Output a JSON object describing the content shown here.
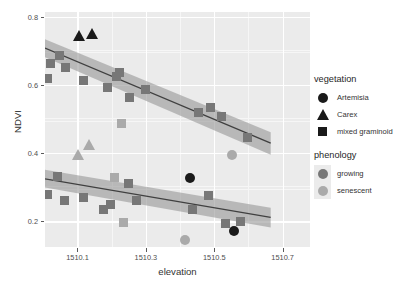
{
  "chart_data": {
    "type": "scatter",
    "title": "",
    "xlabel": "elevation",
    "ylabel": "NDVI",
    "xlim": [
      1510.005,
      1510.78
    ],
    "ylim": [
      0.125,
      0.815
    ],
    "xticks": [
      "1510.1",
      "1510.3",
      "1510.5",
      "1510.7"
    ],
    "xtick_values": [
      1510.1,
      1510.3,
      1510.5,
      1510.7
    ],
    "yticks": [
      "0.2",
      "0.4",
      "0.6",
      "0.8"
    ],
    "ytick_values": [
      0.2,
      0.4,
      0.6,
      0.8
    ],
    "grid": true,
    "legend_position": "right",
    "panel_background": "#ebebeb",
    "colors": {
      "growing": "#777777",
      "senescent": "#aaaaaa",
      "dark_marker": "#1a1a1a",
      "fit_line": "#404040",
      "ribbon_growing": "#9a9a9a",
      "ribbon_senescent": "#b8b8b8"
    },
    "series": [
      {
        "name": "growing",
        "phenology": "growing",
        "color": "#777777",
        "points": [
          {
            "x": 1510.013,
            "y": 0.619,
            "vegetation": "mixed graminoid"
          },
          {
            "x": 1510.02,
            "y": 0.665,
            "vegetation": "mixed graminoid"
          },
          {
            "x": 1510.048,
            "y": 0.686,
            "vegetation": "mixed graminoid"
          },
          {
            "x": 1510.064,
            "y": 0.653,
            "vegetation": "mixed graminoid"
          },
          {
            "x": 1510.118,
            "y": 0.613,
            "vegetation": "mixed graminoid"
          },
          {
            "x": 1510.188,
            "y": 0.592,
            "vegetation": "mixed graminoid"
          },
          {
            "x": 1510.215,
            "y": 0.625,
            "vegetation": "mixed graminoid"
          },
          {
            "x": 1510.223,
            "y": 0.637,
            "vegetation": "mixed graminoid"
          },
          {
            "x": 1510.253,
            "y": 0.563,
            "vegetation": "mixed graminoid"
          },
          {
            "x": 1510.3,
            "y": 0.587,
            "vegetation": "mixed graminoid"
          },
          {
            "x": 1510.454,
            "y": 0.519,
            "vegetation": "mixed graminoid"
          },
          {
            "x": 1510.488,
            "y": 0.536,
            "vegetation": "mixed graminoid"
          },
          {
            "x": 1510.52,
            "y": 0.509,
            "vegetation": "mixed graminoid"
          },
          {
            "x": 1510.596,
            "y": 0.447,
            "vegetation": "mixed graminoid"
          },
          {
            "x": 1510.012,
            "y": 0.279,
            "vegetation": "mixed graminoid"
          },
          {
            "x": 1510.042,
            "y": 0.332,
            "vegetation": "mixed graminoid"
          },
          {
            "x": 1510.063,
            "y": 0.262,
            "vegetation": "mixed graminoid"
          },
          {
            "x": 1510.118,
            "y": 0.27,
            "vegetation": "mixed graminoid"
          },
          {
            "x": 1510.177,
            "y": 0.234,
            "vegetation": "mixed graminoid"
          },
          {
            "x": 1510.196,
            "y": 0.249,
            "vegetation": "mixed graminoid"
          },
          {
            "x": 1510.248,
            "y": 0.312,
            "vegetation": "mixed graminoid"
          },
          {
            "x": 1510.274,
            "y": 0.263,
            "vegetation": "mixed graminoid"
          },
          {
            "x": 1510.437,
            "y": 0.234,
            "vegetation": "mixed graminoid"
          },
          {
            "x": 1510.482,
            "y": 0.277,
            "vegetation": "mixed graminoid"
          },
          {
            "x": 1510.534,
            "y": 0.195,
            "vegetation": "mixed graminoid"
          },
          {
            "x": 1510.578,
            "y": 0.2,
            "vegetation": "mixed graminoid"
          },
          {
            "x": 1510.557,
            "y": 0.172,
            "vegetation": "Artemisia"
          },
          {
            "x": 1510.43,
            "y": 0.327,
            "vegetation": "Artemisia"
          },
          {
            "x": 1510.103,
            "y": 0.745,
            "vegetation": "Carex"
          },
          {
            "x": 1510.143,
            "y": 0.753,
            "vegetation": "Carex"
          }
        ]
      },
      {
        "name": "senescent",
        "phenology": "senescent",
        "color": "#aaaaaa",
        "points": [
          {
            "x": 1510.23,
            "y": 0.487,
            "vegetation": "mixed graminoid"
          },
          {
            "x": 1510.207,
            "y": 0.328,
            "vegetation": "mixed graminoid"
          },
          {
            "x": 1510.235,
            "y": 0.196,
            "vegetation": "mixed graminoid"
          },
          {
            "x": 1510.553,
            "y": 0.394,
            "vegetation": "Artemisia"
          },
          {
            "x": 1510.415,
            "y": 0.147,
            "vegetation": "Artemisia"
          },
          {
            "x": 1510.101,
            "y": 0.396,
            "vegetation": "Carex"
          },
          {
            "x": 1510.135,
            "y": 0.425,
            "vegetation": "Carex"
          }
        ]
      }
    ],
    "fits": [
      {
        "name": "growing-upper-fit",
        "x_start": 1510.005,
        "y_start": 0.709,
        "x_end": 1510.665,
        "y_end": 0.43,
        "band_start_upper": 0.735,
        "band_start_lower": 0.682,
        "band_end_upper": 0.462,
        "band_end_lower": 0.396
      },
      {
        "name": "growing-lower-fit",
        "x_start": 1510.005,
        "y_start": 0.325,
        "x_end": 1510.665,
        "y_end": 0.212,
        "band_start_upper": 0.352,
        "band_start_lower": 0.3,
        "band_end_upper": 0.24,
        "band_end_lower": 0.182
      }
    ]
  },
  "legends": [
    {
      "title": "vegetation",
      "items": [
        {
          "label": "Artemisia",
          "glyph": "circle-icon"
        },
        {
          "label": "Carex",
          "glyph": "triangle-icon"
        },
        {
          "label": "mixed graminoid",
          "glyph": "square-icon"
        }
      ]
    },
    {
      "title": "phenology",
      "items": [
        {
          "label": "growing",
          "glyph": "circle-icon",
          "color": "#777777"
        },
        {
          "label": "senescent",
          "glyph": "circle-icon",
          "color": "#aaaaaa"
        }
      ]
    }
  ]
}
